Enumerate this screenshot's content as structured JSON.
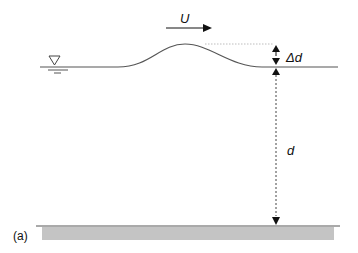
{
  "figure": {
    "panel_label": "(a)",
    "velocity_label": "U",
    "amplitude_label": "Δd",
    "depth_label": "d",
    "colors": {
      "line": "#555555",
      "ink": "#111111",
      "bed_fill": "#c4c4c4",
      "guide": "#bdbdbd"
    },
    "symbols": {
      "water_level": "water-level-triangle-icon"
    }
  }
}
